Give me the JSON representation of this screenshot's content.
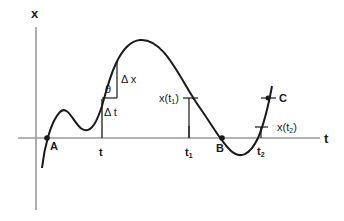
{
  "diagram": {
    "axes": {
      "vertical_label": "x",
      "horizontal_label": "t",
      "axis_color": "#9a9a9a"
    },
    "curve_color": "#1a1a1a",
    "points": {
      "A": "A",
      "B": "B",
      "C": "C"
    },
    "tick_labels": {
      "t": "t",
      "t1": "t",
      "t1_sub": "1",
      "t2": "t",
      "t2_sub": "2"
    },
    "value_labels": {
      "x_t1_prefix": "x(t",
      "x_t1_sub": "1",
      "x_t1_suffix": ")",
      "x_t2_prefix": "x(t",
      "x_t2_sub": "2",
      "x_t2_suffix": ")"
    },
    "slope_triangle": {
      "angle": "θ",
      "delta_x": "Δ x",
      "delta_t": "Δ t"
    }
  }
}
